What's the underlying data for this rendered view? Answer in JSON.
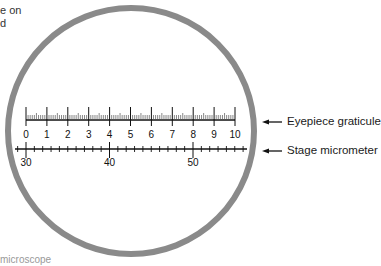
{
  "fragments": {
    "top_left_line1": "e on",
    "top_left_line2": "d",
    "bottom_left": "microscope"
  },
  "field_of_view": {
    "circle_color": "#8a8a8a",
    "center_x": 131,
    "center_y": 131,
    "radius": 123,
    "stroke_width": 6
  },
  "eyepiece_graticule": {
    "label": "Eyepiece graticule",
    "tick_labels": [
      "0",
      "1",
      "2",
      "3",
      "4",
      "5",
      "6",
      "7",
      "8",
      "9",
      "10"
    ],
    "x_start": 26,
    "x_end": 235,
    "baseline_y": 120,
    "minor_per_major": 10
  },
  "stage_micrometer": {
    "label": "Stage micrometer",
    "tick_labels": [
      "30",
      "40",
      "50"
    ],
    "x_30": 26,
    "px_per_division": 8.35,
    "baseline_y": 149,
    "x_line_start": 15,
    "x_line_end": 247
  },
  "arrows": {
    "eyepiece_arrow": "arrow-left",
    "stage_arrow": "arrow-left"
  }
}
